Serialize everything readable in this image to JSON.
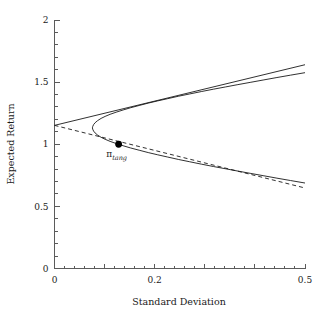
{
  "chart_data": {
    "type": "line",
    "title": "",
    "xlabel": "Standard Deviation",
    "ylabel": "Expected Return",
    "xlim": [
      0,
      0.5
    ],
    "ylim": [
      0,
      2
    ],
    "grid": false,
    "legend": null,
    "x_ticks_major": [
      0,
      0.1,
      0.2,
      0.3,
      0.4,
      0.5
    ],
    "x_ticks_labeled": [
      "0",
      "0.2",
      "0.5"
    ],
    "x_tick_label_values": [
      0,
      0.2,
      0.5
    ],
    "x_tick_minor_step": 0.02,
    "y_ticks_major": [
      0,
      0.5,
      1,
      1.5,
      2
    ],
    "y_ticks_labeled": [
      "0",
      "0.5",
      "1",
      "1.5",
      "2"
    ],
    "y_tick_minor_step": 0.1,
    "annotations": [
      {
        "name": "tangency-portfolio",
        "symbol": "π",
        "subscript": "tang",
        "x": 0.128,
        "y": 1.0,
        "marker": "filled-circle"
      }
    ],
    "series": [
      {
        "name": "efficient-frontier-upper",
        "style": "solid",
        "comment": "Upper branch of the mean-variance hyperbola",
        "points": [
          [
            0.0757,
            1.132
          ],
          [
            0.0762,
            1.142
          ],
          [
            0.078,
            1.158
          ],
          [
            0.081,
            1.173
          ],
          [
            0.086,
            1.19
          ],
          [
            0.093,
            1.208
          ],
          [
            0.101,
            1.224
          ],
          [
            0.111,
            1.241
          ],
          [
            0.123,
            1.258
          ],
          [
            0.137,
            1.276
          ],
          [
            0.152,
            1.294
          ],
          [
            0.169,
            1.312
          ],
          [
            0.187,
            1.331
          ],
          [
            0.206,
            1.349
          ],
          [
            0.226,
            1.367
          ],
          [
            0.248,
            1.387
          ],
          [
            0.27,
            1.405
          ],
          [
            0.293,
            1.424
          ],
          [
            0.317,
            1.443
          ],
          [
            0.341,
            1.461
          ],
          [
            0.366,
            1.48
          ],
          [
            0.392,
            1.499
          ],
          [
            0.418,
            1.518
          ],
          [
            0.444,
            1.537
          ],
          [
            0.471,
            1.556
          ],
          [
            0.5,
            1.576
          ]
        ]
      },
      {
        "name": "efficient-frontier-lower",
        "style": "solid",
        "comment": "Lower branch of the mean-variance hyperbola",
        "points": [
          [
            0.0757,
            1.132
          ],
          [
            0.0762,
            1.122
          ],
          [
            0.078,
            1.106
          ],
          [
            0.081,
            1.091
          ],
          [
            0.086,
            1.074
          ],
          [
            0.093,
            1.056
          ],
          [
            0.101,
            1.04
          ],
          [
            0.111,
            1.023
          ],
          [
            0.123,
            1.006
          ],
          [
            0.137,
            0.988
          ],
          [
            0.152,
            0.97
          ],
          [
            0.169,
            0.952
          ],
          [
            0.187,
            0.933
          ],
          [
            0.206,
            0.915
          ],
          [
            0.226,
            0.897
          ],
          [
            0.248,
            0.877
          ],
          [
            0.27,
            0.859
          ],
          [
            0.293,
            0.84
          ],
          [
            0.317,
            0.821
          ],
          [
            0.341,
            0.803
          ],
          [
            0.366,
            0.784
          ],
          [
            0.392,
            0.765
          ],
          [
            0.418,
            0.746
          ],
          [
            0.444,
            0.727
          ],
          [
            0.471,
            0.708
          ],
          [
            0.5,
            0.688
          ]
        ]
      },
      {
        "name": "capital-market-line",
        "style": "solid",
        "comment": "Tangent line from the risk-free rate through the tangency portfolio",
        "points": [
          [
            0,
            1.152
          ],
          [
            0.5,
            1.64
          ]
        ]
      },
      {
        "name": "asymptote",
        "style": "dashed",
        "comment": "Dashed asymptote of the hyperbola through the tangency region",
        "points": [
          [
            0,
            1.152
          ],
          [
            0.5,
            0.648
          ]
        ]
      }
    ],
    "risk_free_rate": 1.152,
    "min_variance_point": {
      "x": 0.0757,
      "y": 1.132
    }
  },
  "axes": {
    "x_title": "Standard Deviation",
    "y_title": "Expected Return",
    "x_labels": [
      {
        "value": 0,
        "text": "0"
      },
      {
        "value": 0.2,
        "text": "0.2"
      },
      {
        "value": 0.5,
        "text": "0.5"
      }
    ],
    "y_labels": [
      {
        "value": 0,
        "text": "0"
      },
      {
        "value": 0.5,
        "text": "0.5"
      },
      {
        "value": 1,
        "text": "1"
      },
      {
        "value": 1.5,
        "text": "1.5"
      },
      {
        "value": 2,
        "text": "2"
      }
    ]
  },
  "labels": {
    "tangency_symbol": "π",
    "tangency_subscript": "tang"
  },
  "colors": {
    "background": "#ffffff",
    "curve": "#1a1a1a",
    "axis": "#5b5b5b",
    "text": "#1a1a1a",
    "marker": "#000000"
  }
}
